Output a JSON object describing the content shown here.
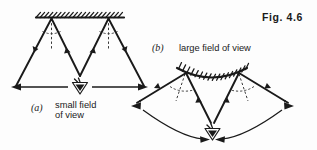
{
  "figure": {
    "label": "Fig. 4.6",
    "background_color": "#fdfdfd",
    "ink_color": "#1a1a1a",
    "topic": "Field of view of a plane mirror compared with a convex mirror"
  },
  "panels": [
    {
      "id": "a",
      "letter": "(a)",
      "caption_line_1": "small field",
      "caption_line_2": "of view",
      "mirror_type": "plane-mirror",
      "mirror_label": "flat hatched mirror surface",
      "field_of_view": "small",
      "eye_symbol": "observer-eye",
      "ray_count": 2,
      "normals": 2,
      "angle_marks": 2
    },
    {
      "id": "b",
      "letter": "(b)",
      "caption_line_1": "large field of view",
      "caption_line_2": "",
      "mirror_type": "convex-mirror",
      "mirror_label": "curved hatched mirror surface",
      "field_of_view": "large",
      "eye_symbol": "observer-eye",
      "ray_count": 2,
      "normals": 2,
      "angle_marks": 2
    }
  ],
  "annotations": {
    "fov_arrow_a": "double-headed horizontal arrow spanning small field of view",
    "fov_arrow_b": "double-headed curved arc spanning large field of view"
  }
}
